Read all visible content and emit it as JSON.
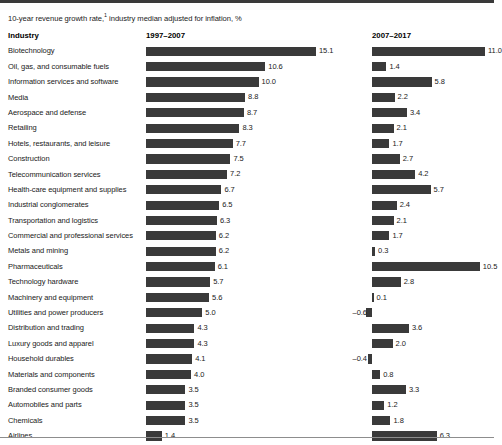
{
  "subtitle": {
    "text_before": "10-year revenue growth rate,",
    "footnote_marker": "1",
    "text_after": " industry median adjusted for inflation, %"
  },
  "headers": {
    "industry": "Industry",
    "period1": "1997–2007",
    "period2": "2007–2017"
  },
  "colors": {
    "bar": "#3a3a3a",
    "top_rule": "#3a3a3a",
    "bottom_rule": "#8d8d8d",
    "background": "#ffffff",
    "text": "#1a1a1a"
  },
  "chart_data": {
    "type": "bar",
    "xlabel": "",
    "ylabel": "Industry",
    "orientation": "horizontal",
    "grid": false,
    "legend": "none",
    "panels": [
      "1997–2007",
      "2007–2017"
    ],
    "xlim_period1": [
      0,
      15.1
    ],
    "xlim_period2": [
      -0.6,
      11.0
    ],
    "categories": [
      "Biotechnology",
      "Oil, gas, and consumable fuels",
      "Information services and software",
      "Media",
      "Aerospace and defense",
      "Retailing",
      "Hotels, restaurants, and leisure",
      "Construction",
      "Telecommunication services",
      "Health-care equipment and supplies",
      "Industrial conglomerates",
      "Transportation and logistics",
      "Commercial and professional services",
      "Metals and mining",
      "Pharmaceuticals",
      "Technology hardware",
      "Machinery and equipment",
      "Utilities and power producers",
      "Distribution and trading",
      "Luxury goods and apparel",
      "Household durables",
      "Materials and components",
      "Branded consumer goods",
      "Automobiles and parts",
      "Chemicals",
      "Airlines"
    ],
    "series": [
      {
        "name": "1997–2007",
        "values": [
          15.1,
          10.6,
          10.0,
          8.8,
          8.7,
          8.3,
          7.7,
          7.5,
          7.2,
          6.7,
          6.5,
          6.3,
          6.2,
          6.2,
          6.1,
          5.7,
          5.6,
          5.0,
          4.3,
          4.3,
          4.1,
          4.0,
          3.5,
          3.5,
          3.5,
          1.4
        ],
        "labels": [
          "15.1",
          "10.6",
          "10.0",
          "8.8",
          "8.7",
          "8.3",
          "7.7",
          "7.5",
          "7.2",
          "6.7",
          "6.5",
          "6.3",
          "6.2",
          "6.2",
          "6.1",
          "5.7",
          "5.6",
          "5.0",
          "4.3",
          "4.3",
          "4.1",
          "4.0",
          "3.5",
          "3.5",
          "3.5",
          "1.4"
        ]
      },
      {
        "name": "2007–2017",
        "values": [
          11.0,
          1.4,
          5.8,
          2.2,
          3.4,
          2.1,
          1.7,
          2.7,
          4.2,
          5.7,
          2.4,
          2.1,
          1.7,
          0.3,
          10.5,
          2.8,
          0.1,
          -0.6,
          3.6,
          2.0,
          -0.4,
          0.8,
          3.3,
          1.2,
          1.8,
          6.3
        ],
        "labels": [
          "11.0",
          "1.4",
          "5.8",
          "2.2",
          "3.4",
          "2.1",
          "1.7",
          "2.7",
          "4.2",
          "5.7",
          "2.4",
          "2.1",
          "1.7",
          "0.3",
          "10.5",
          "2.8",
          "0.1",
          "–0.6",
          "3.6",
          "2.0",
          "–0.4",
          "0.8",
          "3.3",
          "1.2",
          "1.8",
          "6.3"
        ]
      }
    ]
  }
}
